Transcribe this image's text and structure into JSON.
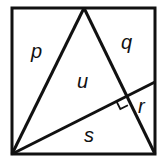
{
  "diagram": {
    "colors": {
      "stroke": "#111111",
      "background": "#ffffff"
    },
    "labels": {
      "p": "p",
      "q": "q",
      "u": "u",
      "r": "r",
      "s": "s"
    },
    "annotations": {
      "right_angle_marker": "right angle between the line and the triangle side"
    }
  }
}
